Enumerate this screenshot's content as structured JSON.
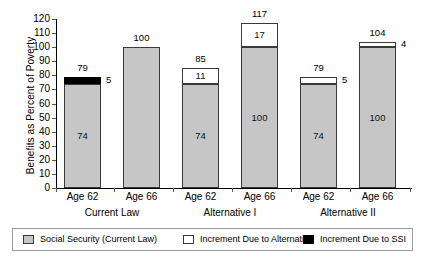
{
  "chart_data": {
    "type": "bar",
    "title": "",
    "xlabel": "",
    "ylabel": "Benefits as Percent of Poverty",
    "ylim": [
      0,
      120
    ],
    "ytick_step": 10,
    "yticks": [
      "0",
      "10",
      "20",
      "30",
      "40",
      "50",
      "60",
      "70",
      "80",
      "90",
      "100",
      "110",
      "120"
    ],
    "grid": false,
    "stacked": true,
    "legend_position": "bottom",
    "categories": [
      "Age 62",
      "Age 66",
      "Age 62",
      "Age 66",
      "Age 62",
      "Age 66"
    ],
    "groups": [
      {
        "label": "Current Law",
        "categories": [
          "Age 62",
          "Age 66"
        ]
      },
      {
        "label": "Alternative I",
        "categories": [
          "Age 62",
          "Age 66"
        ]
      },
      {
        "label": "Alternative II",
        "categories": [
          "Age 62",
          "Age 66"
        ]
      }
    ],
    "series": [
      {
        "name": "Social Security (Current Law)",
        "color": "#c6c6c6",
        "values": [
          74,
          100,
          74,
          100,
          74,
          100
        ]
      },
      {
        "name": "Increment Due to Alternative",
        "color": "#ffffff",
        "values": [
          0,
          0,
          11,
          17,
          5,
          4
        ]
      },
      {
        "name": "Increment Due to SSI",
        "color": "#000000",
        "values": [
          5,
          0,
          0,
          0,
          0,
          0
        ]
      }
    ],
    "totals": [
      79,
      100,
      85,
      117,
      79,
      104
    ],
    "bars": [
      {
        "group": "Current Law",
        "category": "Age 62",
        "total": "79",
        "segments": [
          {
            "series": "Social Security (Current Law)",
            "value": 74,
            "label": "74",
            "label_position": "inside"
          },
          {
            "series": "Increment Due to SSI",
            "value": 5,
            "label": "5",
            "label_position": "outside-right"
          }
        ]
      },
      {
        "group": "Current Law",
        "category": "Age 66",
        "total": "100",
        "segments": [
          {
            "series": "Social Security (Current Law)",
            "value": 100,
            "label": "",
            "label_position": "none"
          }
        ]
      },
      {
        "group": "Alternative I",
        "category": "Age 62",
        "total": "85",
        "segments": [
          {
            "series": "Social Security (Current Law)",
            "value": 74,
            "label": "74",
            "label_position": "inside"
          },
          {
            "series": "Increment Due to Alternative",
            "value": 11,
            "label": "11",
            "label_position": "inside"
          }
        ]
      },
      {
        "group": "Alternative I",
        "category": "Age 66",
        "total": "117",
        "segments": [
          {
            "series": "Social Security (Current Law)",
            "value": 100,
            "label": "100",
            "label_position": "inside"
          },
          {
            "series": "Increment Due to Alternative",
            "value": 17,
            "label": "17",
            "label_position": "inside"
          }
        ]
      },
      {
        "group": "Alternative II",
        "category": "Age 62",
        "total": "79",
        "segments": [
          {
            "series": "Social Security (Current Law)",
            "value": 74,
            "label": "74",
            "label_position": "inside"
          },
          {
            "series": "Increment Due to Alternative",
            "value": 5,
            "label": "5",
            "label_position": "outside-right"
          }
        ]
      },
      {
        "group": "Alternative II",
        "category": "Age 66",
        "total": "104",
        "segments": [
          {
            "series": "Social Security (Current Law)",
            "value": 100,
            "label": "100",
            "label_position": "inside"
          },
          {
            "series": "Increment Due to Alternative",
            "value": 4,
            "label": "4",
            "label_position": "outside-right"
          }
        ]
      }
    ],
    "legend": [
      {
        "label": "Social Security (Current Law)",
        "color": "#c6c6c6"
      },
      {
        "label": "Increment Due to Alternative",
        "color": "#ffffff"
      },
      {
        "label": "Increment Due to SSI",
        "color": "#000000"
      }
    ]
  }
}
